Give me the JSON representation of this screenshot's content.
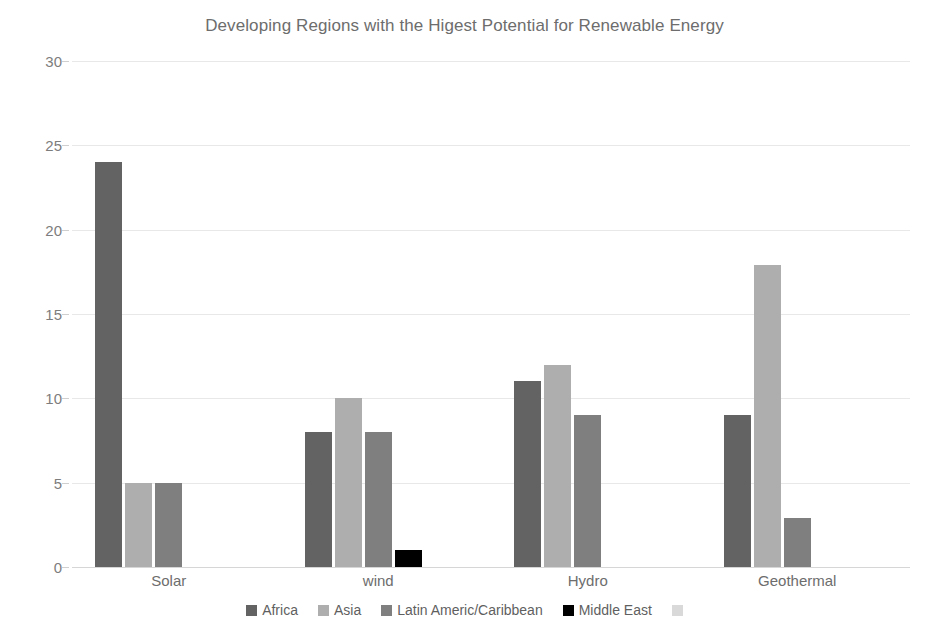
{
  "chart_data": {
    "type": "bar",
    "title": "Developing Regions with the Higest Potential for Renewable Energy",
    "xlabel": "",
    "ylabel": "",
    "categories": [
      "Solar",
      "wind",
      "Hydro",
      "Geothermal"
    ],
    "series": [
      {
        "name": "Africa",
        "color": "#636363",
        "values": [
          24,
          8,
          11,
          9
        ]
      },
      {
        "name": "Asia",
        "color": "#aeaeae",
        "values": [
          5,
          10,
          12,
          17.9
        ]
      },
      {
        "name": "Latin Americ/Caribbean",
        "color": "#7f7f7f",
        "values": [
          5,
          8,
          9,
          2.9
        ]
      },
      {
        "name": "Middle East",
        "color": "#000000",
        "values": [
          0,
          1,
          0,
          0
        ]
      },
      {
        "name": "",
        "color": "#d9d9d9",
        "values": [
          0,
          0,
          0,
          0
        ]
      }
    ],
    "ylim": [
      0,
      30
    ],
    "yticks": [
      0,
      5,
      10,
      15,
      20,
      25,
      30
    ],
    "ytick_labels": [
      "0",
      "5",
      "10",
      "15",
      "20",
      "25",
      "30"
    ],
    "grid": true,
    "legend_position": "bottom"
  },
  "colors": {
    "background": "#ffffff",
    "gridline": "#e8e8e8",
    "axis_text": "#7d7d7d",
    "title_text": "#6d6d6d"
  }
}
